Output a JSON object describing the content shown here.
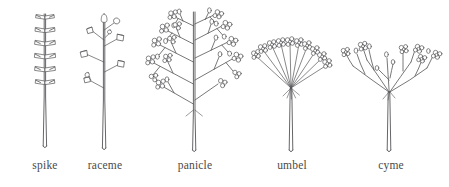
{
  "figure": {
    "background_color": "#ffffff",
    "ink_color": "#555558",
    "label_color": "#4a4a4a",
    "panel_count": 5
  },
  "panels": [
    {
      "id": "spike",
      "label": "spike",
      "description": "Unbranched axis bearing sessile flowers attached directly to the stem in opposite tiers",
      "flower_arrangement": "sessile, paired in tiers",
      "tier_count": 6,
      "branching": "none",
      "flower_stalks": "absent"
    },
    {
      "id": "raceme",
      "label": "raceme",
      "description": "Unbranched axis bearing stalked cup-shaped flowers alternating along its length",
      "flower_arrangement": "pedicellate, alternate",
      "flower_count": 8,
      "branching": "none",
      "flower_stalks": "present"
    },
    {
      "id": "panicle",
      "label": "panicle",
      "description": "Branched raceme; secondary branches each carry several small flowers and buds",
      "flower_arrangement": "compound branched clusters",
      "branch_count": 9,
      "branching": "compound",
      "flower_stalks": "present"
    },
    {
      "id": "umbel",
      "label": "umbel",
      "description": "Rays of equal length radiating from a single point to form a flat-topped cluster",
      "flower_arrangement": "rays from one node",
      "ray_count": 10,
      "branching": "single node",
      "flower_stalks": "present"
    },
    {
      "id": "cyme",
      "label": "cyme",
      "description": "Branches fork and re-divide, each axis terminating in a flower",
      "flower_arrangement": "repeatedly forking, flowers at tips",
      "primary_branch_count": 4,
      "branching": "dichotomous forking",
      "flower_stalks": "present"
    }
  ]
}
